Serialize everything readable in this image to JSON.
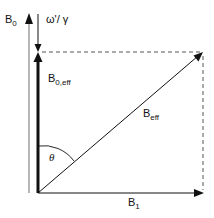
{
  "diagram": {
    "labels": {
      "b0": {
        "main": "B",
        "sub": "0"
      },
      "omega": {
        "text": "ω'/ γ"
      },
      "b0eff": {
        "main": "B",
        "sub": "0,eff"
      },
      "beff": {
        "main": "B",
        "sub": "eff"
      },
      "theta": {
        "text": "θ"
      },
      "b1": {
        "main": "B",
        "sub": "1"
      }
    },
    "colors": {
      "line": "#111111",
      "gray_line": "#888888",
      "dashed": "#555555"
    }
  }
}
